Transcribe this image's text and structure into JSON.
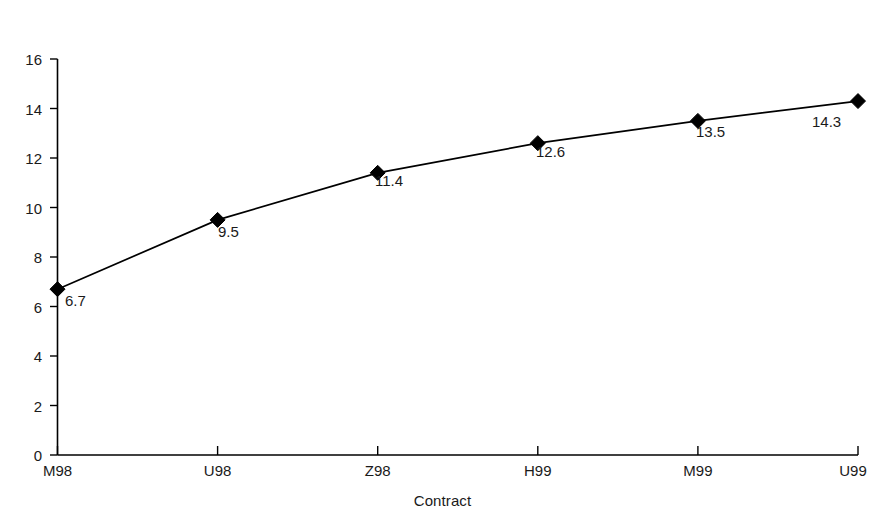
{
  "chart_data": {
    "type": "line",
    "title": "",
    "subtitle": "",
    "xlabel": "Contract",
    "ylabel": "Volatility (%)",
    "categories": [
      "M98",
      "U98",
      "Z98",
      "H99",
      "M99",
      "U99"
    ],
    "values": [
      6.7,
      9.5,
      11.4,
      12.6,
      13.5,
      14.3
    ],
    "point_labels": [
      "6.7",
      "9.5",
      "11.4",
      "12.6",
      "13.5",
      "14.3"
    ],
    "series": [
      {
        "name": "Volatility",
        "values": [
          6.7,
          9.5,
          11.4,
          12.6,
          13.5,
          14.3
        ],
        "marker": "diamond",
        "marker_color": "#000000",
        "line_color": "#000000"
      }
    ],
    "ylim": [
      0,
      16
    ],
    "ytick_step": 2,
    "ytick_labels": [
      "0",
      "2",
      "4",
      "6",
      "8",
      "10",
      "12",
      "14",
      "16"
    ],
    "xtick_labels": [
      "M98",
      "U98",
      "Z98",
      "H99",
      "M99",
      "U99"
    ],
    "grid": false,
    "legend": false,
    "legend_position": "none",
    "background_color": "#ffffff",
    "axis_color": "#000000"
  }
}
